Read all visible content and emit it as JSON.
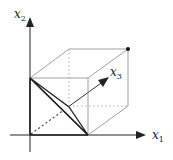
{
  "diagram": {
    "title": "",
    "axes": {
      "x1": {
        "label": "x",
        "subscript": "1"
      },
      "x2": {
        "label": "x",
        "subscript": "2"
      },
      "x3": {
        "label": "x",
        "subscript": "3"
      }
    },
    "colors": {
      "axis": "#222222",
      "box": "#888888",
      "hidden": "#999999",
      "simplex": "#222222"
    },
    "elements": [
      "coordinate axes x1, x2, x3",
      "unit cube (solid visible edges, dotted hidden edges)",
      "shaded triangle / simplex from x2-axis point to x1-axis point through x3 point",
      "dot at far cube vertex"
    ]
  }
}
